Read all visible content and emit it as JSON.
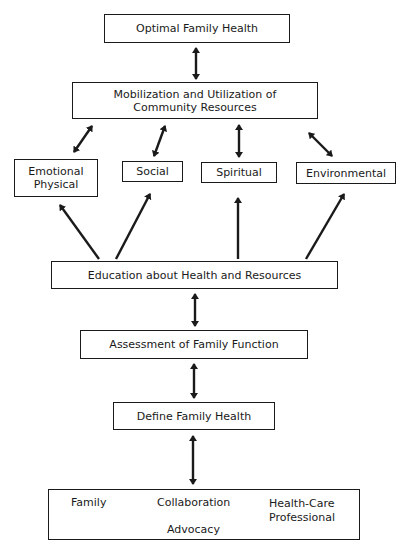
{
  "diagram": {
    "nodes": {
      "optimal": {
        "label": "Optimal Family Health"
      },
      "mobilization": {
        "line1": "Mobilization and Utilization of",
        "line2": "Community Resources"
      },
      "emotional": {
        "line1": "Emotional",
        "line2": "Physical"
      },
      "social": {
        "label": "Social"
      },
      "spiritual": {
        "label": "Spiritual"
      },
      "environmental": {
        "label": "Environmental"
      },
      "education": {
        "label": "Education about Health and Resources"
      },
      "assessment": {
        "label": "Assessment of Family Function"
      },
      "define": {
        "label": "Define Family Health"
      },
      "partnership": {
        "family": "Family",
        "collaboration": "Collaboration",
        "advocacy": "Advocacy",
        "professional_line1": "Health-Care",
        "professional_line2": "Professional"
      }
    },
    "edges": [
      {
        "from": "optimal",
        "to": "mobilization",
        "type": "bidirectional"
      },
      {
        "from": "mobilization",
        "to": "emotional",
        "type": "bidirectional"
      },
      {
        "from": "mobilization",
        "to": "social",
        "type": "bidirectional"
      },
      {
        "from": "mobilization",
        "to": "spiritual",
        "type": "bidirectional"
      },
      {
        "from": "mobilization",
        "to": "environmental",
        "type": "bidirectional"
      },
      {
        "from": "education",
        "to": "emotional",
        "type": "directed"
      },
      {
        "from": "education",
        "to": "social",
        "type": "directed"
      },
      {
        "from": "education",
        "to": "spiritual",
        "type": "directed"
      },
      {
        "from": "education",
        "to": "environmental",
        "type": "directed"
      },
      {
        "from": "education",
        "to": "assessment",
        "type": "bidirectional"
      },
      {
        "from": "assessment",
        "to": "define",
        "type": "bidirectional"
      },
      {
        "from": "define",
        "to": "partnership",
        "type": "bidirectional"
      },
      {
        "from": "family",
        "to": "health-care-professional",
        "type": "bidirectional"
      }
    ],
    "colors": {
      "stroke": "#1a1a1a",
      "background": "#ffffff"
    }
  }
}
